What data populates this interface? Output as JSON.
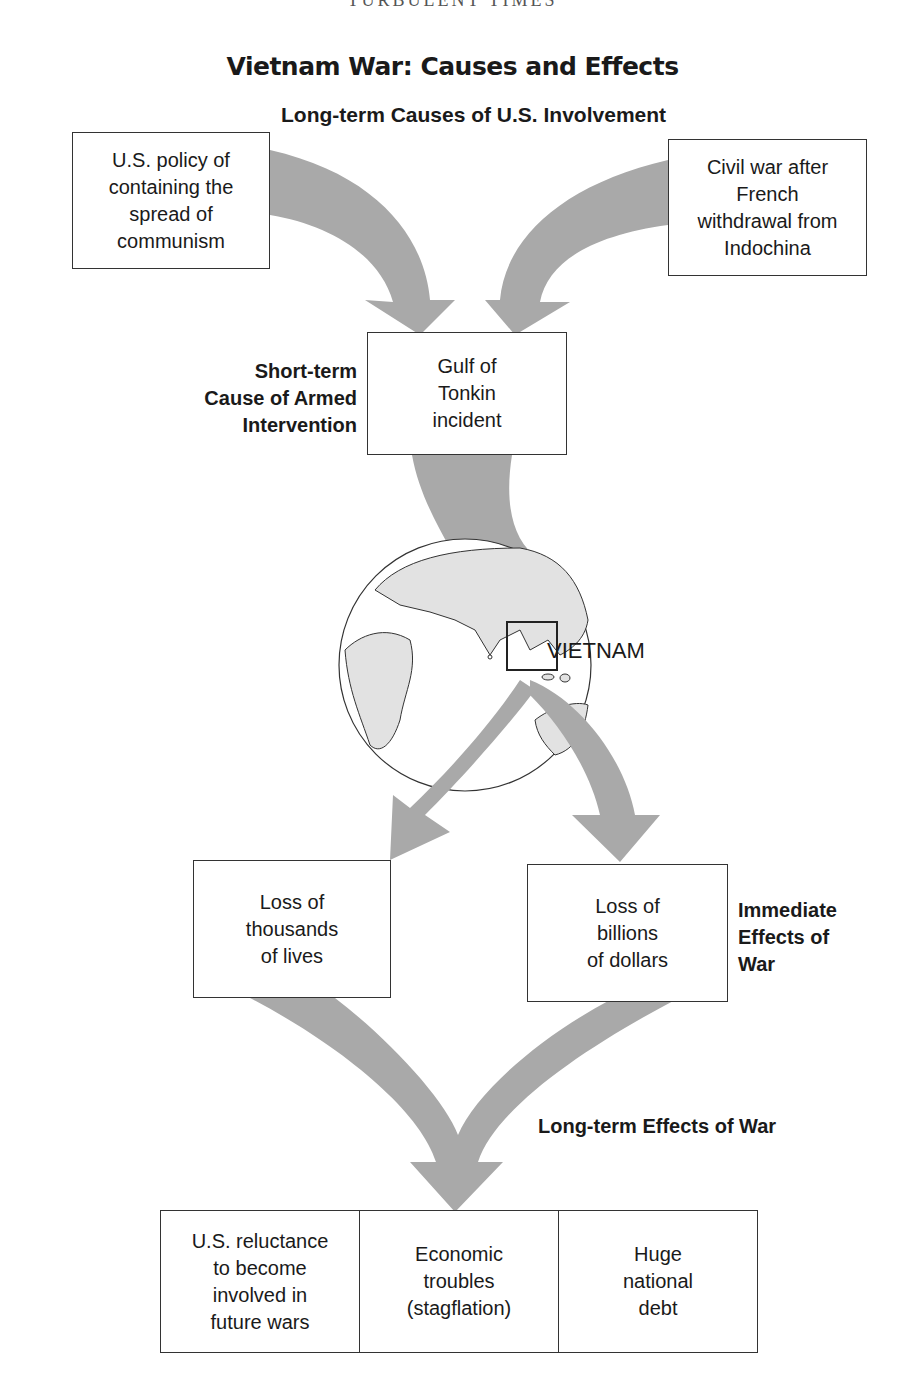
{
  "header": {
    "clipped_text": "TURBULENT TIMES"
  },
  "title": "Vietnam War: Causes and Effects",
  "sections": {
    "long_term_causes": "Long-term Causes of U.S. Involvement",
    "short_term_cause": "Short-term\nCause of Armed\nIntervention",
    "immediate_effects": "Immediate\nEffects of\nWar",
    "long_term_effects": "Long-term Effects of War"
  },
  "causes": [
    {
      "text": "U.S. policy of\ncontaining the\nspread of\ncommunism"
    },
    {
      "text": "Civil war after\nFrench\nwithdrawal from\nIndochina"
    }
  ],
  "short_term": {
    "text": "Gulf of\nTonkin\nincident"
  },
  "globe": {
    "label": "VIETNAM",
    "icon": "globe-icon"
  },
  "immediate": [
    {
      "text": "Loss of\nthousands\nof lives"
    },
    {
      "text": "Loss of\nbillions\nof dollars"
    }
  ],
  "long_term": [
    {
      "text": "U.S. reluctance\nto become\ninvolved in\nfuture wars"
    },
    {
      "text": "Economic\ntroubles\n(stagflation)"
    },
    {
      "text": "Huge\nnational\ndebt"
    }
  ],
  "colors": {
    "arrow": "#a9a9a9",
    "land": "#e2e2e2",
    "border": "#333333"
  }
}
